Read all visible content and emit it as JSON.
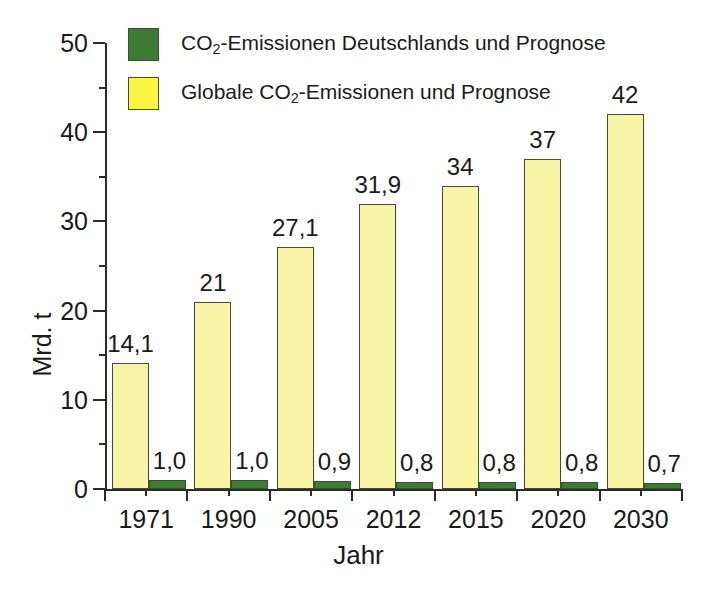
{
  "chart_data": {
    "type": "bar",
    "title": "",
    "subtitle": "",
    "xlabel": "Jahr",
    "ylabel": "Mrd. t",
    "categories": [
      "1971",
      "1990",
      "2005",
      "2012",
      "2015",
      "2020",
      "2030"
    ],
    "ylim": [
      0,
      50
    ],
    "yticks": [
      0,
      10,
      20,
      30,
      40,
      50
    ],
    "ytick_labels": [
      "0",
      "10",
      "20",
      "30",
      "40",
      "50"
    ],
    "yminor_ticks": [
      5,
      15,
      25,
      35,
      45
    ],
    "grid": false,
    "legend_position": "top-left",
    "series": [
      {
        "name": "Globale CO2-Emissionen und Prognose",
        "name_parts": {
          "pre": "Globale CO",
          "sub": "2",
          "post": "-Emissionen und Prognose"
        },
        "color": "#f7f5a5",
        "legend_color": "#f9f542",
        "values": [
          14.1,
          21,
          27.1,
          31.9,
          34,
          37,
          42
        ],
        "labels": [
          "14,1",
          "21",
          "27,1",
          "31,9",
          "34",
          "37",
          "42"
        ]
      },
      {
        "name": "CO2-Emissionen Deutschlands und Prognose",
        "name_parts": {
          "pre": "CO",
          "sub": "2",
          "post": "-Emissionen Deutschlands und Prognose"
        },
        "color": "#3d7a33",
        "legend_color": "#3d7a33",
        "values": [
          1.0,
          1.0,
          0.9,
          0.8,
          0.8,
          0.8,
          0.7
        ],
        "labels": [
          "1,0",
          "1,0",
          "0,9",
          "0,8",
          "0,8",
          "0,8",
          "0,7"
        ]
      }
    ]
  },
  "axes": {
    "y_title": "Mrd. t",
    "x_title": "Jahr"
  },
  "legend": {
    "entries": [
      {
        "label": "CO2-Emissionen Deutschlands und Prognose",
        "swatch": "germany"
      },
      {
        "label": "Globale CO2-Emissionen und Prognose",
        "swatch": "global"
      }
    ]
  }
}
